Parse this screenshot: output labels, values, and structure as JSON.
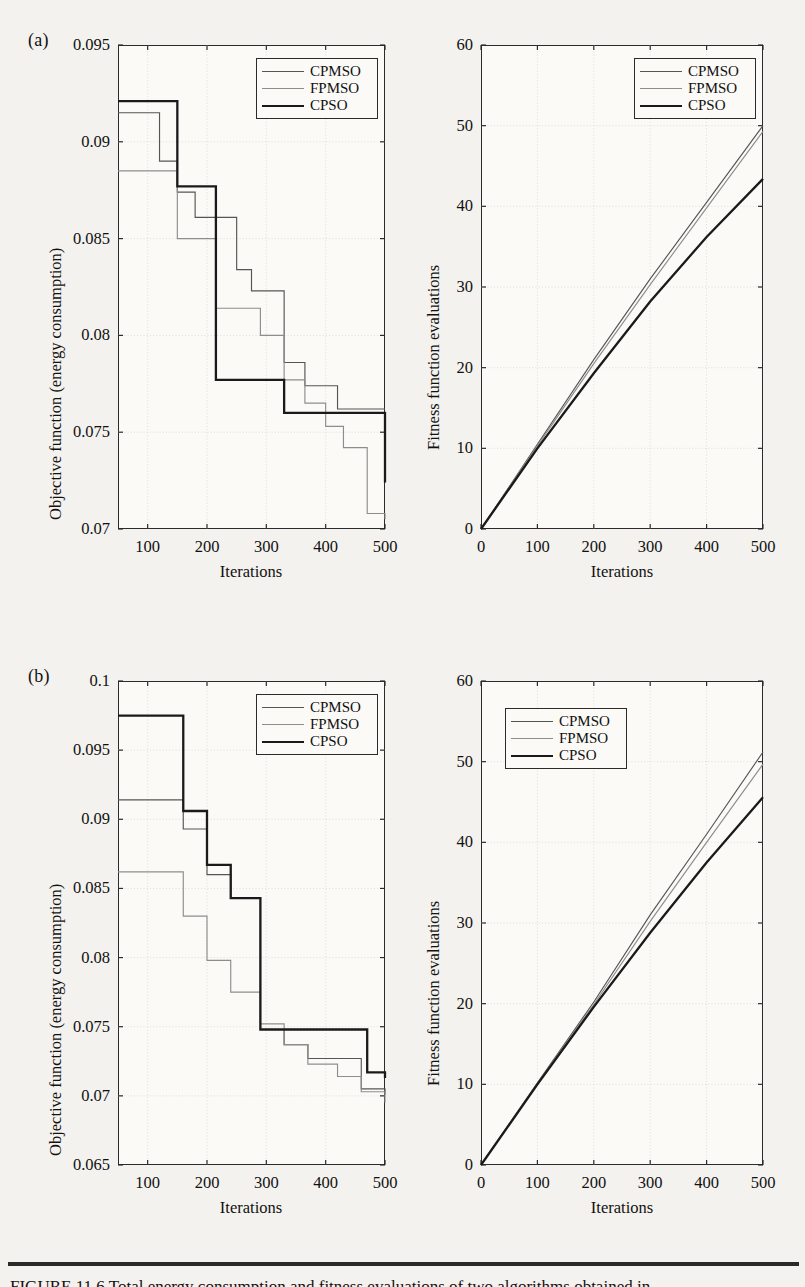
{
  "figure": {
    "panel_a_letter": "(a)",
    "panel_b_letter": "(b)",
    "caption": "FIGURE 11.6   Total energy consumption and fitness evaluations of two algorithms obtained in"
  },
  "axis_titles": {
    "iterations": "Iterations",
    "objective": "Objective function (energy consumption)",
    "fitness": "Fitness function evaluations"
  },
  "legend": {
    "entries": [
      "CPMSO",
      "FPMSO",
      "CPSO"
    ]
  },
  "colors": {
    "cpmso": "#555555",
    "fpmso": "#8d8d8d",
    "cpso": "#1a1a1a",
    "axis": "#2b2b2b",
    "grid": "#d8d6d0",
    "paper": "#f4f2ee"
  },
  "chart_data": [
    {
      "id": "a-left",
      "type": "line",
      "title": "",
      "xlabel": "Iterations",
      "ylabel": "Objective function (energy consumption)",
      "xlim": [
        50,
        500
      ],
      "ylim": [
        0.07,
        0.095
      ],
      "xticks": [
        100,
        200,
        300,
        400,
        500
      ],
      "yticks": [
        0.07,
        0.075,
        0.08,
        0.085,
        0.09,
        0.095
      ],
      "yticklabels": [
        "0.07",
        "0.075",
        "0.08",
        "0.085",
        "0.09",
        "0.095"
      ],
      "grid": true,
      "legend_position": "upper-right",
      "step": "post",
      "series": [
        {
          "name": "CPMSO",
          "x": [
            50,
            120,
            150,
            180,
            215,
            250,
            275,
            300,
            330,
            365,
            420,
            500
          ],
          "values": [
            0.0915,
            0.089,
            0.0874,
            0.0861,
            0.0861,
            0.0834,
            0.0823,
            0.0823,
            0.0786,
            0.0774,
            0.0762,
            0.0762
          ]
        },
        {
          "name": "FPMSO",
          "x": [
            50,
            120,
            150,
            180,
            215,
            250,
            290,
            330,
            365,
            400,
            430,
            470,
            500
          ],
          "values": [
            0.0885,
            0.0885,
            0.085,
            0.085,
            0.0814,
            0.0814,
            0.08,
            0.0777,
            0.0765,
            0.0753,
            0.0742,
            0.0708,
            0.0705
          ]
        },
        {
          "name": "CPSO",
          "x": [
            50,
            120,
            150,
            215,
            290,
            330,
            420,
            500
          ],
          "values": [
            0.0921,
            0.0921,
            0.0877,
            0.0777,
            0.0777,
            0.076,
            0.076,
            0.0724
          ]
        }
      ]
    },
    {
      "id": "a-right",
      "type": "line",
      "title": "",
      "xlabel": "Iterations",
      "ylabel": "Fitness function evaluations",
      "xlim": [
        0,
        500
      ],
      "ylim": [
        0,
        60
      ],
      "xticks": [
        0,
        100,
        200,
        300,
        400,
        500
      ],
      "yticks": [
        0,
        10,
        20,
        30,
        40,
        50,
        60
      ],
      "grid": true,
      "legend_position": "upper-right",
      "series": [
        {
          "name": "CPMSO",
          "x": [
            0,
            100,
            200,
            300,
            400,
            500
          ],
          "values": [
            0,
            10.5,
            21.0,
            31.0,
            40.5,
            50.0
          ]
        },
        {
          "name": "FPMSO",
          "x": [
            0,
            100,
            200,
            300,
            400,
            500
          ],
          "values": [
            0,
            10.3,
            20.5,
            30.3,
            39.8,
            49.3
          ]
        },
        {
          "name": "CPSO",
          "x": [
            0,
            100,
            200,
            300,
            400,
            500
          ],
          "values": [
            0,
            10.0,
            19.3,
            28.2,
            36.2,
            43.4
          ]
        }
      ]
    },
    {
      "id": "b-left",
      "type": "line",
      "title": "",
      "xlabel": "Iterations",
      "ylabel": "Objective function (energy consumption)",
      "xlim": [
        50,
        500
      ],
      "ylim": [
        0.065,
        0.1
      ],
      "xticks": [
        100,
        200,
        300,
        400,
        500
      ],
      "yticks": [
        0.065,
        0.07,
        0.075,
        0.08,
        0.085,
        0.09,
        0.095,
        0.1
      ],
      "yticklabels": [
        "0.065",
        "0.07",
        "0.075",
        "0.08",
        "0.085",
        "0.09",
        "0.095",
        "0.1"
      ],
      "grid": true,
      "legend_position": "upper-right",
      "step": "post",
      "series": [
        {
          "name": "CPMSO",
          "x": [
            50,
            120,
            160,
            200,
            240,
            290,
            330,
            370,
            420,
            460,
            500
          ],
          "values": [
            0.0914,
            0.0914,
            0.0893,
            0.086,
            0.0843,
            0.0748,
            0.0737,
            0.0727,
            0.0727,
            0.0705,
            0.0701
          ]
        },
        {
          "name": "FPMSO",
          "x": [
            50,
            120,
            160,
            200,
            240,
            290,
            330,
            370,
            420,
            460,
            500
          ],
          "values": [
            0.0862,
            0.0862,
            0.083,
            0.0798,
            0.0775,
            0.0752,
            0.0737,
            0.0723,
            0.0714,
            0.0703,
            0.0695
          ]
        },
        {
          "name": "CPSO",
          "x": [
            50,
            120,
            160,
            200,
            240,
            290,
            440,
            470,
            500
          ],
          "values": [
            0.0975,
            0.0975,
            0.0906,
            0.0867,
            0.0843,
            0.0748,
            0.0748,
            0.0717,
            0.0713
          ]
        }
      ]
    },
    {
      "id": "b-right",
      "type": "line",
      "title": "",
      "xlabel": "Iterations",
      "ylabel": "Fitness function evaluations",
      "xlim": [
        0,
        500
      ],
      "ylim": [
        0,
        60
      ],
      "xticks": [
        0,
        100,
        200,
        300,
        400,
        500
      ],
      "yticks": [
        0,
        10,
        20,
        30,
        40,
        50,
        60
      ],
      "grid": true,
      "legend_position": "upper-left",
      "series": [
        {
          "name": "CPMSO",
          "x": [
            0,
            100,
            200,
            300,
            400,
            500
          ],
          "values": [
            0,
            10.2,
            20.2,
            31.0,
            41.0,
            51.2
          ]
        },
        {
          "name": "FPMSO",
          "x": [
            0,
            100,
            200,
            300,
            400,
            500
          ],
          "values": [
            0,
            10.1,
            19.9,
            30.2,
            40.0,
            49.7
          ]
        },
        {
          "name": "CPSO",
          "x": [
            0,
            100,
            200,
            300,
            400,
            500
          ],
          "values": [
            0,
            10.0,
            19.6,
            28.8,
            37.5,
            45.6
          ]
        }
      ]
    }
  ]
}
